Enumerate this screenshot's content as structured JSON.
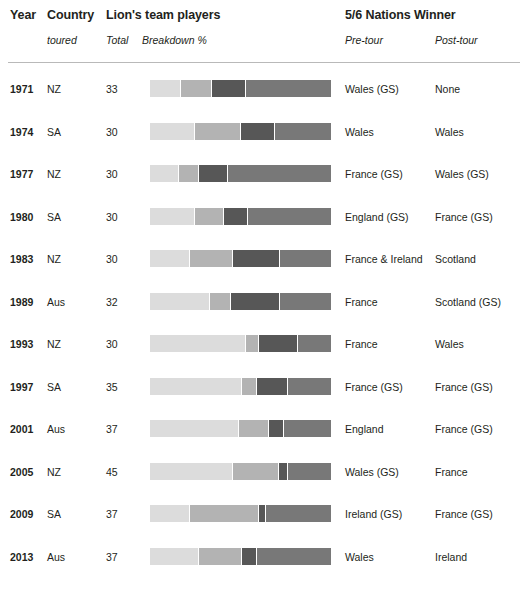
{
  "header": {
    "year": "Year",
    "country": "Country",
    "country_sub": "toured",
    "players_title": "Lion's team players",
    "total_sub": "Total",
    "breakdown_sub": "Breakdown %",
    "nations_title": "5/6 Nations Winner",
    "pre_tour_sub": "Pre-tour",
    "post_tour_sub": "Post-tour"
  },
  "palette": {
    "seg1": "#dcdcdc",
    "seg2": "#b3b3b3",
    "seg3": "#575757",
    "seg4": "#787878",
    "rule": "#b9b9b9",
    "text": "#231f20"
  },
  "chart_data": {
    "type": "bar",
    "title": "Lion's team players",
    "subtitle": "Breakdown %",
    "orientation": "horizontal-stacked",
    "xlabel": "Breakdown %",
    "ylabel": "Year",
    "xlim": [
      0,
      100
    ],
    "grid": false,
    "legend": null,
    "series": [
      {
        "name": "segment-1",
        "color": "#dcdcdc",
        "values": [
          17,
          25,
          16,
          25,
          22,
          33,
          53,
          51,
          49,
          46,
          22,
          27
        ]
      },
      {
        "name": "segment-2",
        "color": "#b3b3b3",
        "values": [
          17,
          25,
          11,
          16,
          24,
          12,
          7,
          8,
          17,
          25,
          38,
          24
        ]
      },
      {
        "name": "segment-3",
        "color": "#575757",
        "values": [
          19,
          19,
          16,
          13,
          26,
          27,
          22,
          17,
          8,
          5,
          4,
          8
        ]
      },
      {
        "name": "segment-4",
        "color": "#787878",
        "values": [
          47,
          31,
          57,
          46,
          28,
          28,
          18,
          24,
          26,
          24,
          36,
          41
        ]
      }
    ],
    "categories": [
      "1971",
      "1974",
      "1977",
      "1980",
      "1983",
      "1989",
      "1993",
      "1997",
      "2001",
      "2005",
      "2009",
      "2013"
    ]
  },
  "rows": [
    {
      "year": "1971",
      "country": "NZ",
      "total": "33",
      "pre_tour": "Wales (GS)",
      "post_tour": "None",
      "segments": [
        17,
        17,
        19,
        47
      ]
    },
    {
      "year": "1974",
      "country": "SA",
      "total": "30",
      "pre_tour": "Wales",
      "post_tour": "Wales",
      "segments": [
        25,
        25,
        19,
        31
      ]
    },
    {
      "year": "1977",
      "country": "NZ",
      "total": "30",
      "pre_tour": "France (GS)",
      "post_tour": "Wales (GS)",
      "segments": [
        16,
        11,
        16,
        57
      ]
    },
    {
      "year": "1980",
      "country": "SA",
      "total": "30",
      "pre_tour": "England (GS)",
      "post_tour": "France (GS)",
      "segments": [
        25,
        16,
        13,
        46
      ]
    },
    {
      "year": "1983",
      "country": "NZ",
      "total": "30",
      "pre_tour": "France & Ireland",
      "post_tour": "Scotland",
      "segments": [
        22,
        24,
        26,
        28
      ]
    },
    {
      "year": "1989",
      "country": "Aus",
      "total": "32",
      "pre_tour": "France",
      "post_tour": "Scotland (GS)",
      "segments": [
        33,
        12,
        27,
        28
      ]
    },
    {
      "year": "1993",
      "country": "NZ",
      "total": "30",
      "pre_tour": "France",
      "post_tour": "Wales",
      "segments": [
        53,
        7,
        22,
        18
      ]
    },
    {
      "year": "1997",
      "country": "SA",
      "total": "35",
      "pre_tour": "France (GS)",
      "post_tour": "France (GS)",
      "segments": [
        51,
        8,
        17,
        24
      ]
    },
    {
      "year": "2001",
      "country": "Aus",
      "total": "37",
      "pre_tour": "England",
      "post_tour": "France (GS)",
      "segments": [
        49,
        17,
        8,
        26
      ]
    },
    {
      "year": "2005",
      "country": "NZ",
      "total": "45",
      "pre_tour": "Wales (GS)",
      "post_tour": "France",
      "segments": [
        46,
        25,
        5,
        24
      ]
    },
    {
      "year": "2009",
      "country": "SA",
      "total": "37",
      "pre_tour": "Ireland (GS)",
      "post_tour": "France (GS)",
      "segments": [
        22,
        38,
        4,
        36
      ]
    },
    {
      "year": "2013",
      "country": "Aus",
      "total": "37",
      "pre_tour": "Wales",
      "post_tour": "Ireland",
      "segments": [
        27,
        24,
        8,
        41
      ]
    }
  ]
}
